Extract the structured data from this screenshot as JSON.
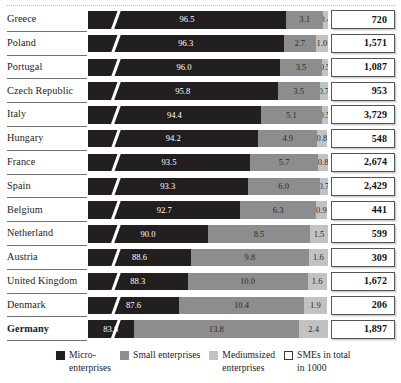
{
  "chart_data": {
    "type": "bar",
    "subtype": "horizontal-stacked-100-percent",
    "title": "",
    "xlabel": "",
    "ylabel": "",
    "xlim": [
      0,
      100
    ],
    "grid": false,
    "axis_break": true,
    "legend_position": "bottom",
    "categories": [
      "Greece",
      "Poland",
      "Portugal",
      "Czech Republic",
      "Italy",
      "Hungary",
      "France",
      "Spain",
      "Belgium",
      "Netherland",
      "Austria",
      "United Kingdom",
      "Denmark",
      "Germany"
    ],
    "series": [
      {
        "name": "Micro-enterprises",
        "color": "#231f20",
        "values": [
          96.5,
          96.3,
          96.0,
          95.8,
          94.4,
          94.2,
          93.5,
          93.3,
          92.7,
          90.0,
          88.6,
          88.3,
          87.6,
          83.8
        ]
      },
      {
        "name": "Small enterprises",
        "color": "#8d8d8d",
        "values": [
          3.1,
          2.7,
          3.5,
          3.5,
          5.1,
          4.9,
          5.7,
          6.0,
          6.3,
          8.5,
          9.8,
          10.0,
          10.4,
          13.8
        ]
      },
      {
        "name": "Mediumsized enterprises",
        "color": "#c2c2c2",
        "values": [
          0.4,
          1.0,
          0.5,
          0.7,
          0.5,
          0.8,
          0.8,
          0.7,
          0.9,
          1.5,
          1.6,
          1.6,
          1.9,
          2.4
        ]
      },
      {
        "name": "SMEs in total in 1000",
        "color": "#ffffff",
        "values": [
          720,
          1571,
          1087,
          953,
          3729,
          548,
          2674,
          2429,
          441,
          599,
          309,
          1672,
          206,
          1897
        ]
      }
    ]
  },
  "rows": [
    {
      "country": "Greece",
      "micro": "96.5",
      "small": "3.1",
      "medium": "0.4",
      "total": "720",
      "bold": false
    },
    {
      "country": "Poland",
      "micro": "96.3",
      "small": "2.7",
      "medium": "1.0",
      "total": "1,571",
      "bold": false
    },
    {
      "country": "Portugal",
      "micro": "96.0",
      "small": "3.5",
      "medium": "0.5",
      "total": "1,087",
      "bold": false
    },
    {
      "country": "Czech Republic",
      "micro": "95.8",
      "small": "3.5",
      "medium": "0.7",
      "total": "953",
      "bold": false
    },
    {
      "country": "Italy",
      "micro": "94.4",
      "small": "5.1",
      "medium": "0.5",
      "total": "3,729",
      "bold": false
    },
    {
      "country": "Hungary",
      "micro": "94.2",
      "small": "4.9",
      "medium": "0.8",
      "total": "548",
      "bold": false
    },
    {
      "country": "France",
      "micro": "93.5",
      "small": "5.7",
      "medium": "0.8",
      "total": "2,674",
      "bold": false
    },
    {
      "country": "Spain",
      "micro": "93.3",
      "small": "6.0",
      "medium": "0.7",
      "total": "2,429",
      "bold": false
    },
    {
      "country": "Belgium",
      "micro": "92.7",
      "small": "6.3",
      "medium": "0.9",
      "total": "441",
      "bold": false
    },
    {
      "country": "Netherland",
      "micro": "90.0",
      "small": "8.5",
      "medium": "1.5",
      "total": "599",
      "bold": false
    },
    {
      "country": "Austria",
      "micro": "88.6",
      "small": "9.8",
      "medium": "1.6",
      "total": "309",
      "bold": false
    },
    {
      "country": "United Kingdom",
      "micro": "88.3",
      "small": "10.0",
      "medium": "1.6",
      "total": "1,672",
      "bold": false
    },
    {
      "country": "Denmark",
      "micro": "87.6",
      "small": "10.4",
      "medium": "1.9",
      "total": "206",
      "bold": false
    },
    {
      "country": "Germany",
      "micro": "83.8",
      "small": "13.8",
      "medium": "2.4",
      "total": "1,897",
      "bold": true
    }
  ],
  "legend": {
    "items": [
      {
        "label": "Micro-\nenterprises",
        "swatch": "sw-micro",
        "color": "#231f20"
      },
      {
        "label": "Small enterprises",
        "swatch": "sw-small",
        "color": "#8d8d8d"
      },
      {
        "label": "Mediumsized\nenterprises",
        "swatch": "sw-medium",
        "color": "#c2c2c2"
      },
      {
        "label": "SMEs in total\nin 1000",
        "swatch": "sw-total",
        "color": "#ffffff"
      }
    ]
  },
  "scale": {
    "axis_min_percent": 80,
    "bar_pixel_width": 240
  }
}
